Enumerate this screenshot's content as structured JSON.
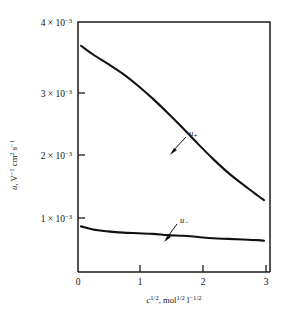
{
  "chart_data": {
    "type": "line",
    "title": "",
    "xlabel": "c^1/2, mol^1/2 l^-1/2",
    "ylabel": "u, V^-1 cm^2 s^-1",
    "xlim": [
      0,
      3.2
    ],
    "ylim": [
      0,
      0.004
    ],
    "grid": false,
    "legend": "inline annotations with leader arrows",
    "x_ticks": [
      0,
      1,
      2,
      3
    ],
    "x_tick_labels": [
      "0",
      "1",
      "2",
      "3"
    ],
    "y_ticks": [
      0.001,
      0.002,
      0.003,
      0.004
    ],
    "y_tick_labels": [
      "1 × 10⁻³",
      "2 × 10⁻³",
      "3 × 10⁻³",
      "4 × 10⁻³"
    ],
    "series": [
      {
        "name": "u+",
        "label": "u₊",
        "x": [
          0.05,
          0.25,
          0.5,
          0.75,
          1.0,
          1.25,
          1.5,
          1.75,
          2.0,
          2.25,
          2.5,
          2.75,
          3.0,
          3.1
        ],
        "values": [
          0.00362,
          0.00348,
          0.00333,
          0.00317,
          0.00298,
          0.00277,
          0.00254,
          0.0023,
          0.00205,
          0.00181,
          0.00159,
          0.0014,
          0.00122,
          0.00115
        ]
      },
      {
        "name": "u-",
        "label": "u₋",
        "x": [
          0.05,
          0.25,
          0.5,
          0.75,
          1.0,
          1.25,
          1.5,
          1.75,
          2.0,
          2.25,
          2.5,
          2.75,
          3.0,
          3.1
        ],
        "values": [
          0.00073,
          0.00068,
          0.00065,
          0.00063,
          0.00062,
          0.00061,
          0.00059,
          0.00058,
          0.00056,
          0.00054,
          0.00053,
          0.00052,
          0.00051,
          0.0005
        ]
      }
    ]
  },
  "axes": {
    "y_title": {
      "symbol": "u",
      "comma": ", V",
      "sup1": "−1",
      "mid": " cm",
      "sup2": "2",
      "tail": " s",
      "sup3": "−1"
    },
    "x_title": {
      "symbol": "c",
      "sup1": "1/2",
      "comma": ", mol",
      "sup2": "1/2",
      "unit": " l",
      "sup3": "−1/2"
    },
    "y_tick_0": {
      "mantissa": "1 × 10",
      "exponent": "−3"
    },
    "y_tick_1": {
      "mantissa": "2 × 10",
      "exponent": "−3"
    },
    "y_tick_2": {
      "mantissa": "3 × 10",
      "exponent": "−3"
    },
    "y_tick_3": {
      "mantissa": "4 × 10",
      "exponent": "−3"
    },
    "x_tick_0": "0",
    "x_tick_1": "1",
    "x_tick_2": "2",
    "x_tick_3": "3"
  },
  "annotations": {
    "cation": {
      "symbol": "u",
      "sub": "+"
    },
    "anion": {
      "symbol": "u",
      "sub": "−"
    }
  },
  "colors": {
    "curve": "#111111",
    "frame": "#1a1a1a",
    "background": "#ffffff"
  }
}
